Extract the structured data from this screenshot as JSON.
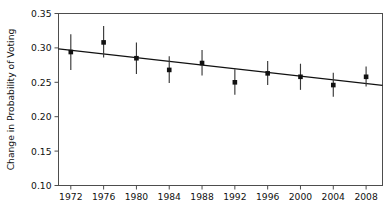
{
  "chart_data": {
    "type": "scatter",
    "title": "",
    "subtitle": "",
    "xlabel": "",
    "ylabel": "Change in Probability of Voting",
    "x": [
      1972,
      1976,
      1980,
      1984,
      1988,
      1992,
      1996,
      2000,
      2004,
      2008
    ],
    "categories": [
      "1972",
      "1976",
      "1980",
      "1984",
      "1988",
      "1992",
      "1996",
      "2000",
      "2004",
      "2008"
    ],
    "values": [
      0.294,
      0.308,
      0.285,
      0.268,
      0.278,
      0.25,
      0.263,
      0.258,
      0.246,
      0.258
    ],
    "error_low": [
      0.268,
      0.286,
      0.262,
      0.249,
      0.26,
      0.232,
      0.246,
      0.239,
      0.229,
      0.244
    ],
    "error_high": [
      0.32,
      0.332,
      0.308,
      0.288,
      0.297,
      0.269,
      0.281,
      0.277,
      0.264,
      0.273
    ],
    "series": [
      {
        "name": "Point estimates",
        "values": [
          0.294,
          0.308,
          0.285,
          0.268,
          0.278,
          0.25,
          0.263,
          0.258,
          0.246,
          0.258
        ]
      },
      {
        "name": "Linear fit",
        "endpoints": [
          {
            "x": 1970.5,
            "y": 0.2985
          },
          {
            "x": 2010.0,
            "y": 0.2455
          }
        ]
      }
    ],
    "xlim": [
      1970.5,
      2010.0
    ],
    "ylim": [
      0.1,
      0.35
    ],
    "yticks": [
      0.1,
      0.15,
      0.2,
      0.25,
      0.3,
      0.35
    ],
    "ytick_labels": [
      "0.10",
      "0.15",
      "0.20",
      "0.25",
      "0.30",
      "0.35"
    ],
    "xticks": [
      1972,
      1976,
      1980,
      1984,
      1988,
      1992,
      1996,
      2000,
      2004,
      2008
    ],
    "xtick_labels": [
      "1972",
      "1976",
      "1980",
      "1984",
      "1988",
      "1992",
      "1996",
      "2000",
      "2004",
      "2008"
    ],
    "grid": false,
    "legend": null,
    "legend_position": "none",
    "annotations": [],
    "marker_style": "filled-square",
    "error_bar_style": "vertical-capless",
    "fit_line_style": "solid"
  },
  "axes": {
    "y_axis_title": "Change in Probability of Voting",
    "x_axis_title": ""
  },
  "colors": {
    "marker": "#111111",
    "errorbar": "#3a3a3a",
    "fit_line": "#111111",
    "frame": "#4d4d4d",
    "text": "#111111",
    "background": "#ffffff"
  }
}
